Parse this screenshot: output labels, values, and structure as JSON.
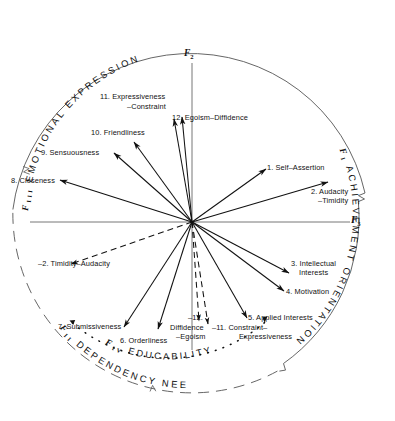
{
  "figure": {
    "type": "vector-diagram"
  },
  "axes": {
    "vertical": {
      "label": "F",
      "subscript": "2"
    },
    "horizontal": {
      "label": "F",
      "subscript": "3"
    }
  },
  "quadrant_arcs": [
    {
      "id": "f3-emotional",
      "factor": "F",
      "factor_sub": "III",
      "text": "E M O T I O N A L   E X P R E S S I O N",
      "position": "top",
      "line_style": "solid"
    },
    {
      "id": "f1-achievement",
      "factor": "F",
      "factor_sub": "I",
      "text": "A C H I E V E M E N T   O R I E N T A T I O N",
      "position": "right",
      "line_style": "solid"
    },
    {
      "id": "f2-dependency",
      "factor": "F",
      "factor_sub": "II",
      "text": "D E P E N D E N C Y   N E E D S",
      "position": "bottom-left",
      "line_style": "dashed"
    },
    {
      "id": "f4-educability",
      "factor": "F",
      "factor_sub": "IV",
      "text": "E D U C A B I L I T Y",
      "position": "inner-bottom",
      "line_style": "dotted"
    }
  ],
  "vectors": [
    {
      "id": "v1",
      "number": "1.",
      "label_line1": "1.  Self-Assertion",
      "label_line2": "",
      "angle_deg": 23.5,
      "length": 108,
      "style": "solid",
      "arrow": true
    },
    {
      "id": "v2",
      "number": "2.",
      "label_line1": "2. Audacity",
      "label_line2": "–Timidity",
      "angle_deg": 9.0,
      "length": 138,
      "style": "solid",
      "arrow": true
    },
    {
      "id": "v3",
      "number": "3.",
      "label_line1": "3. Intellectual",
      "label_line2": "Interests",
      "angle_deg": -27.0,
      "length": 110,
      "style": "solid",
      "arrow": true
    },
    {
      "id": "v4",
      "number": "4.",
      "label_line1": "4. Motivation",
      "label_line2": "",
      "angle_deg": -36.0,
      "length": 118,
      "style": "solid",
      "arrow": true
    },
    {
      "id": "v5",
      "number": "5.",
      "label_line1": "5. Applied Interests",
      "label_line2": "",
      "angle_deg": -59.0,
      "length": 110,
      "style": "solid",
      "arrow": true
    },
    {
      "id": "v6",
      "number": "6.",
      "label_line1": "6. Orderliness",
      "label_line2": "",
      "angle_deg": -105.0,
      "length": 115,
      "style": "solid",
      "arrow": true
    },
    {
      "id": "v7",
      "number": "7.",
      "label_line1": "7. Submissiveness",
      "label_line2": "",
      "angle_deg": -118.0,
      "length": 118,
      "style": "solid",
      "arrow": true
    },
    {
      "id": "v8",
      "number": "8.",
      "label_line1": "8. Closeness",
      "label_line2": "",
      "angle_deg": 172.0,
      "length": 128,
      "style": "solid",
      "arrow": true
    },
    {
      "id": "v9",
      "number": "9.",
      "label_line1": "9. Sensuousness",
      "label_line2": "",
      "angle_deg": 144.0,
      "length": 106,
      "style": "solid",
      "arrow": true
    },
    {
      "id": "v10",
      "number": "10.",
      "label_line1": "10. Friendliness",
      "label_line2": "",
      "angle_deg": 131.0,
      "length": 102,
      "style": "solid",
      "arrow": true
    },
    {
      "id": "v11",
      "number": "11.",
      "label_line1": "11. Expressiveness",
      "label_line2": "–Constraint",
      "angle_deg": 99.0,
      "length": 104,
      "style": "solid",
      "arrow": true
    },
    {
      "id": "v12",
      "number": "12.",
      "label_line1": "12. Egoism–Diffidence",
      "label_line2": "",
      "angle_deg": 95.0,
      "length": 110,
      "style": "solid",
      "arrow": true
    },
    {
      "id": "v2n",
      "number": "–2.",
      "label_line1": "–2. Timidity–Audacity",
      "label_line2": "",
      "angle_deg": -171.0,
      "length": 123,
      "style": "dashed",
      "arrow": true
    },
    {
      "id": "v11n",
      "number": "–11.",
      "label_line1": "–11. Constraint–",
      "label_line2": "Expressiveness",
      "angle_deg": -81.0,
      "length": 104,
      "style": "dashed",
      "arrow": true
    },
    {
      "id": "v12n",
      "number": "–12.",
      "label_line1": "–12.",
      "label_line2": "Diffidence\n–Egoism",
      "angle_deg": -85.0,
      "length": 98,
      "style": "dashed",
      "arrow": true
    }
  ],
  "labels": {
    "v1": "1. Self–Assertion",
    "v2a": "2. Audacity",
    "v2b": "–Timidity",
    "v3a": "3. Intellectual",
    "v3b": "Interests",
    "v4": "4. Motivation",
    "v5": "5. Applied Interests",
    "v6": "6. Orderliness",
    "v7": "7. Submissiveness",
    "v8": "8. Closeness",
    "v9": "9. Sensuousness",
    "v10": "10. Friendliness",
    "v11a": "11. Expressiveness",
    "v11b": "–Constraint",
    "v12": "12. Egoism–Diffidence",
    "v2neg": "–2. Timidity–Audacity",
    "v11neg_a": "–11. Constraint–",
    "v11neg_b": "Expressiveness",
    "v12neg_a": "–12.",
    "v12neg_b": "Diffidence",
    "v12neg_c": "–Egoism"
  },
  "arc_text": {
    "emotional": "EMOTIONAL EXPRESSION",
    "achievement": "ACHIEVEMENT ORIENTATION",
    "dependency": "DEPENDENCY NEEDS",
    "educability": "EDUCABILITY",
    "f_roman_3": "F",
    "f_roman_3_sub": "III",
    "f_roman_1": "F",
    "f_roman_1_sub": "I",
    "f_roman_2": "F",
    "f_roman_2_sub": "II",
    "f_roman_4": "F",
    "f_roman_4_sub": "IV"
  },
  "colors": {
    "ink": "#111111",
    "background": "#ffffff",
    "arc": "#555555"
  }
}
